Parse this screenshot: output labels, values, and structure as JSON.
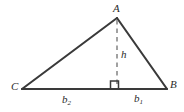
{
  "figure": {
    "kind": "triangle-altitude-diagram",
    "background_color": "#ffffff",
    "stroke_color": "#3a3a3a",
    "dash_color": "#8a8a8a",
    "vertices": {
      "apex_label": "A",
      "right_label": "B",
      "left_label": "C"
    },
    "altitude": {
      "label": "h",
      "style": "dashed",
      "right_angle_marker": true
    },
    "base_segments": [
      {
        "label": "b",
        "subscript": "2",
        "position": "left"
      },
      {
        "label": "b",
        "subscript": "1",
        "position": "right"
      }
    ],
    "geometry": {
      "A": {
        "x": 117,
        "y": 18
      },
      "B": {
        "x": 167,
        "y": 89
      },
      "C": {
        "x": 22,
        "y": 89
      },
      "foot": {
        "x": 117,
        "y": 89
      },
      "right_angle_size": 8
    }
  }
}
